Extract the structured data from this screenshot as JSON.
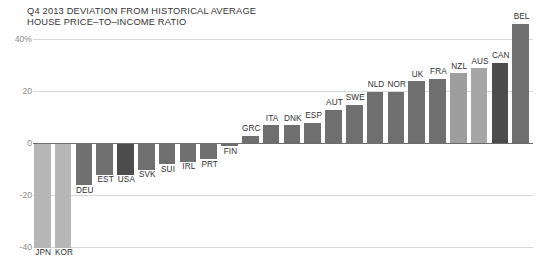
{
  "title": {
    "line1": "Q4 2013 DEVIATION FROM HISTORICAL AVERAGE",
    "line2": "HOUSE PRICE–TO–INCOME RATIO"
  },
  "chart_data": {
    "type": "bar",
    "xlabel": "",
    "ylabel": "",
    "ylim": [
      -40,
      40
    ],
    "yticks": [
      40,
      20,
      0,
      -20,
      -40
    ],
    "ytick_labels": [
      "40%",
      "20",
      "0",
      "-20",
      "-40"
    ],
    "grid": true,
    "legend": false,
    "unit": "percent",
    "categories": [
      "JPN",
      "KOR",
      "DEU",
      "EST",
      "USA",
      "SVK",
      "SUI",
      "IRL",
      "PRT",
      "FIN",
      "GRC",
      "ITA",
      "DNK",
      "ESP",
      "AUT",
      "SWE",
      "NLD",
      "NOR",
      "UK",
      "FRA",
      "NZL",
      "AUS",
      "CAN",
      "BEL"
    ],
    "values": [
      -40,
      -40,
      -16,
      -12,
      -12,
      -10,
      -8,
      -7,
      -6,
      -1,
      3,
      7,
      7,
      8,
      13,
      15,
      20,
      20,
      24,
      25,
      27,
      29,
      31,
      46
    ],
    "bar_colors": [
      "#b6b6b6",
      "#b6b6b6",
      "#6f6f6f",
      "#6f6f6f",
      "#4c4c4c",
      "#6f6f6f",
      "#6f6f6f",
      "#6f6f6f",
      "#6f6f6f",
      "#6f6f6f",
      "#6f6f6f",
      "#6f6f6f",
      "#6f6f6f",
      "#6f6f6f",
      "#6f6f6f",
      "#6f6f6f",
      "#6f6f6f",
      "#6f6f6f",
      "#6f6f6f",
      "#6f6f6f",
      "#9e9e9e",
      "#a6a6a6",
      "#4c4c4c",
      "#6f6f6f"
    ],
    "colors": {
      "default_bar": "#6f6f6f",
      "light_bar": "#b6b6b6",
      "dark_bar": "#4c4c4c",
      "gridline": "#d8d8d8",
      "zero_line": "#6b6b6b",
      "tick_label": "#8c8c8c",
      "bar_label": "#2f2f2f",
      "title_text": "#333333",
      "background": "#ffffff"
    }
  }
}
